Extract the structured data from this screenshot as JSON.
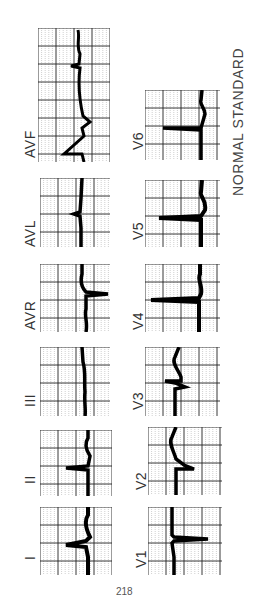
{
  "title": "NORMAL STANDARD",
  "page_number": "218",
  "colors": {
    "grid_major": "#222222",
    "grid_minor": "#888888",
    "trace": "#000000",
    "background": "#ffffff",
    "label": "#333333"
  },
  "leads": [
    {
      "id": "I",
      "label": "I",
      "column": "limb",
      "order": 1
    },
    {
      "id": "II",
      "label": "II",
      "column": "limb",
      "order": 2
    },
    {
      "id": "III",
      "label": "III",
      "column": "limb",
      "order": 3
    },
    {
      "id": "AVR",
      "label": "AVR",
      "column": "limb",
      "order": 4
    },
    {
      "id": "AVL",
      "label": "AVL",
      "column": "limb",
      "order": 5
    },
    {
      "id": "AVF",
      "label": "AVF",
      "column": "limb",
      "order": 6
    },
    {
      "id": "V1",
      "label": "V1",
      "column": "precordial",
      "order": 1
    },
    {
      "id": "V2",
      "label": "V2",
      "column": "precordial",
      "order": 2
    },
    {
      "id": "V3",
      "label": "V3",
      "column": "precordial",
      "order": 3
    },
    {
      "id": "V4",
      "label": "V4",
      "column": "precordial",
      "order": 4
    },
    {
      "id": "V5",
      "label": "V5",
      "column": "precordial",
      "order": 5
    },
    {
      "id": "V6",
      "label": "V6",
      "column": "precordial",
      "order": 6
    }
  ]
}
